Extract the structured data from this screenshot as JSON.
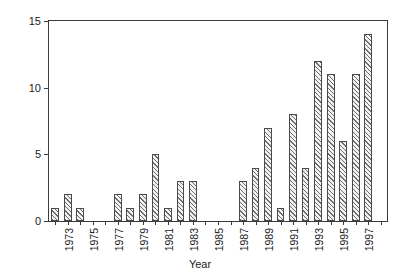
{
  "chart_data": {
    "type": "bar",
    "title": "",
    "xlabel": "Year",
    "ylabel": "Number/year",
    "ylim": [
      0,
      15
    ],
    "yticks": [
      0,
      5,
      10,
      15
    ],
    "ytick_labels": [
      "0",
      "5",
      "10",
      "15"
    ],
    "xlim": [
      1971.5,
      1998.5
    ],
    "grid": false,
    "legend": null,
    "categories": [
      "1972",
      "1973",
      "1974",
      "1975",
      "1976",
      "1977",
      "1978",
      "1979",
      "1980",
      "1981",
      "1982",
      "1983",
      "1984",
      "1985",
      "1986",
      "1987",
      "1988",
      "1989",
      "1990",
      "1991",
      "1992",
      "1993",
      "1994",
      "1995",
      "1996",
      "1997",
      "1998"
    ],
    "values": [
      1,
      2,
      1,
      0,
      0,
      2,
      1,
      2,
      5,
      1,
      3,
      3,
      0,
      0,
      0,
      3,
      4,
      7,
      1,
      8,
      4,
      12,
      11,
      6,
      11,
      14,
      0
    ],
    "xtick_labels": [
      "1973",
      "1975",
      "1977",
      "1979",
      "1981",
      "1983",
      "1985",
      "1987",
      "1989",
      "1991",
      "1993",
      "1995",
      "1997"
    ],
    "colors": {
      "bar_face": "#f2f2f2",
      "bar_edge": "#4a4a4a",
      "hatch": "#6e6e6e",
      "axis": "#3b3b3b",
      "text": "#1a1a1a",
      "background": "#ffffff"
    }
  }
}
